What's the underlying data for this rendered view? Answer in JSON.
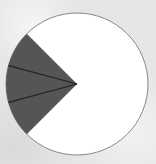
{
  "diagram": {
    "type": "circle-sector-diagram",
    "circle": {
      "cx": 77,
      "cy": 84,
      "r": 71,
      "fill": "#ffffff",
      "stroke": "#888888"
    },
    "shaded_sector": {
      "fill": "#555555",
      "start_angle_deg": 135,
      "end_angle_deg": 225,
      "divisions": 3,
      "divider_color": "#222222"
    },
    "background_color": "#e6e6e6"
  }
}
